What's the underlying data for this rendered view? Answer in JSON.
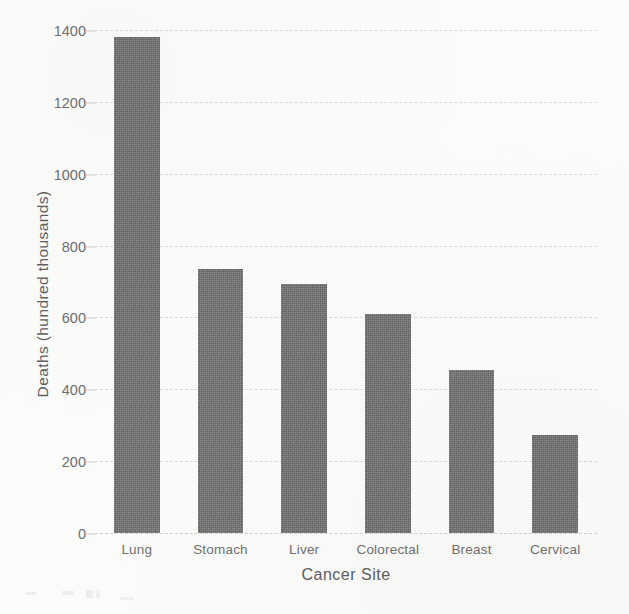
{
  "chart_data": {
    "type": "bar",
    "title": "",
    "xlabel": "Cancer Site",
    "ylabel": "Deaths (hundred thousands)",
    "categories": [
      "Lung",
      "Stomach",
      "Liver",
      "Colorectal",
      "Breast",
      "Cervical"
    ],
    "values": [
      1380,
      736,
      692,
      610,
      455,
      273
    ],
    "ylim": [
      0,
      1400
    ],
    "yticks": [
      0,
      200,
      400,
      600,
      800,
      1000,
      1200,
      1400
    ],
    "ytick_labels": [
      "0",
      "200",
      "400",
      "600",
      "800",
      "1000",
      "1200",
      "1400"
    ],
    "grid": true,
    "grid_style": "dashed-horizontal",
    "legend": "none",
    "bar_color": "#6f6f6f",
    "background_color": "#fbfbfa",
    "text_color": "#6a6a6a"
  },
  "axis": {
    "x_title": "Cancer Site",
    "y_title": "Deaths (hundred thousands)"
  }
}
